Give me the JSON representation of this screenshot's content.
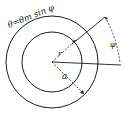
{
  "diagram": {
    "title_equation": "θ=θm sin φ",
    "labels": {
      "radius": "r",
      "inner_radius": "a",
      "angle": "φ"
    },
    "colors": {
      "stroke": "#1a1a1a",
      "background": "#ffffff"
    },
    "geometry": {
      "center": [
        52,
        62
      ],
      "inner_circle_radius": 30,
      "outer_circle_radius": 46
    }
  }
}
